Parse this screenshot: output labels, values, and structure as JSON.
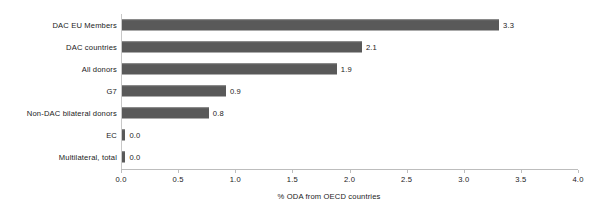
{
  "chart_data": {
    "type": "bar",
    "orientation": "horizontal",
    "title": "",
    "subtitle": "",
    "xlabel": "% ODA from OECD countries",
    "ylabel": "",
    "xlim": [
      0.0,
      4.0
    ],
    "xticks": [
      "0.0",
      "0.5",
      "1.0",
      "1.5",
      "2.0",
      "2.5",
      "3.0",
      "3.5",
      "4.0"
    ],
    "xtick_values": [
      0.0,
      0.5,
      1.0,
      1.5,
      2.0,
      2.5,
      3.0,
      3.5,
      4.0
    ],
    "grid": false,
    "legend": "none",
    "bar_color": "#595959",
    "axis_color": "#bdbdbd",
    "text_color": "#1a1a1a",
    "categories": [
      "DAC EU Members",
      "DAC countries",
      "All donors",
      "G7",
      "Non-DAC bilateral donors",
      "EC",
      "Multilateral, total"
    ],
    "values": [
      3.3,
      2.1,
      1.9,
      0.9,
      0.8,
      0.0,
      0.0
    ],
    "value_labels": [
      "3.3",
      "2.1",
      "1.9",
      "0.9",
      "0.8",
      "0.0",
      "0.0"
    ],
    "bars": [
      {
        "category": "DAC EU Members",
        "value": 3.3,
        "label": "3.3",
        "plot_value": 3.3
      },
      {
        "category": "DAC countries",
        "value": 2.1,
        "label": "2.1",
        "plot_value": 2.1
      },
      {
        "category": "All donors",
        "value": 1.9,
        "label": "1.9",
        "plot_value": 1.88
      },
      {
        "category": "G7",
        "value": 0.9,
        "label": "0.9",
        "plot_value": 0.91
      },
      {
        "category": "Non-DAC bilateral donors",
        "value": 0.8,
        "label": "0.8",
        "plot_value": 0.76
      },
      {
        "category": "EC",
        "value": 0.0,
        "label": "0.0",
        "plot_value": 0.03
      },
      {
        "category": "Multilateral, total",
        "value": 0.0,
        "label": "0.0",
        "plot_value": 0.03
      }
    ]
  }
}
